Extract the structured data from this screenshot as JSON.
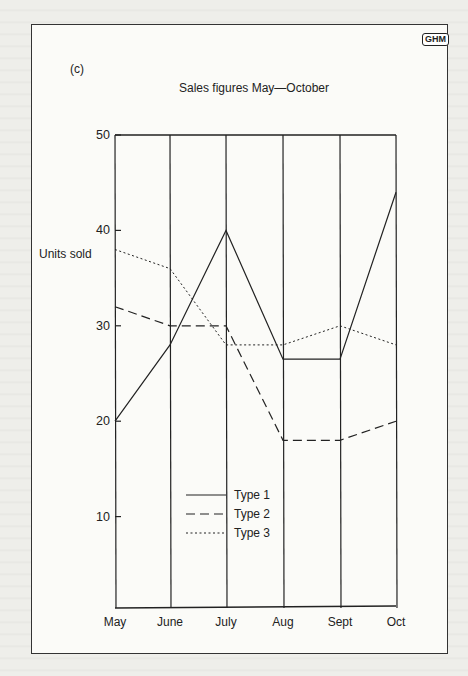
{
  "page": {
    "logo": "GHM",
    "panel_label": "(c)"
  },
  "chart_data": {
    "type": "line",
    "title": "Sales figures May—October",
    "xlabel": "",
    "ylabel": "Units sold",
    "categories": [
      "May",
      "June",
      "July",
      "Aug",
      "Sept",
      "Oct"
    ],
    "yticks": [
      10,
      20,
      30,
      40,
      50
    ],
    "ylim": [
      0,
      50
    ],
    "grid": "vertical lines at each month",
    "legend_position": "inside, lower-left-center",
    "series": [
      {
        "name": "Type 1",
        "style": "solid",
        "values": [
          20,
          28,
          40,
          26.5,
          26.5,
          44
        ]
      },
      {
        "name": "Type 2",
        "style": "dashed",
        "values": [
          32,
          30,
          30,
          18,
          18,
          20
        ]
      },
      {
        "name": "Type 3",
        "style": "dotted",
        "values": [
          38,
          36,
          28,
          28,
          30,
          28
        ]
      }
    ]
  }
}
